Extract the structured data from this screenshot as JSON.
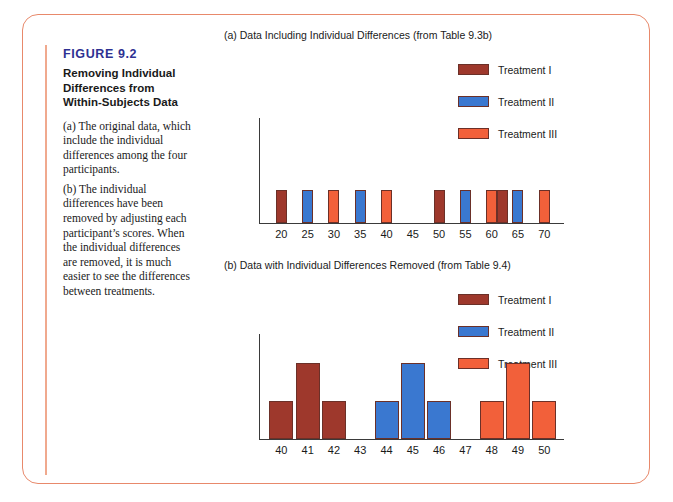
{
  "figure": {
    "number": "FIGURE 9.2",
    "title": "Removing Individual Differences from Within-Subjects Data",
    "paragraph_a": "(a) The original data, which include the individual differences among the four participants.",
    "paragraph_b": "(b) The individual differences have been removed by adjusting each participant’s scores. When the individual differences are removed, it is much easier to see the differences between treatments.",
    "border_color": "#e8896b"
  },
  "colors": {
    "treatment_1": "#9e382c",
    "treatment_2": "#3a78d0",
    "treatment_3": "#f2603a",
    "outline": "#6b3028",
    "axis": "#3a3a3a",
    "fig_number": "#2e3192"
  },
  "legend": {
    "items": [
      {
        "label": "Treatment I",
        "color": "#9e382c"
      },
      {
        "label": "Treatment II",
        "color": "#3a78d0"
      },
      {
        "label": "Treatment III",
        "color": "#f2603a"
      }
    ]
  },
  "chart_data": [
    {
      "id": "panel-a",
      "type": "bar",
      "title": "(a) Data Including Individual Differences (from Table 9.3b)",
      "xlabel": "",
      "ylabel": "",
      "grid": false,
      "legend_position": "top-right",
      "categories": [
        20,
        25,
        30,
        35,
        40,
        45,
        50,
        55,
        60,
        65,
        70
      ],
      "tick_labels": [
        "20",
        "25",
        "30",
        "35",
        "40",
        "45",
        "50",
        "55",
        "60",
        "65",
        "70"
      ],
      "ylim": [
        0,
        3
      ],
      "series": [
        {
          "name": "Treatment I",
          "color": "#9e382c",
          "points": [
            [
              20,
              1
            ],
            [
              30,
              1
            ],
            [
              50,
              1
            ],
            [
              62,
              1
            ]
          ]
        },
        {
          "name": "Treatment II",
          "color": "#3a78d0",
          "points": [
            [
              25,
              1
            ],
            [
              35,
              1
            ],
            [
              55,
              1
            ],
            [
              65,
              1
            ]
          ]
        },
        {
          "name": "Treatment III",
          "color": "#f2603a",
          "points": [
            [
              30,
              1
            ],
            [
              40,
              1
            ],
            [
              60,
              1
            ],
            [
              70,
              1
            ]
          ]
        }
      ],
      "note": "All bars have frequency 1; bars at 30 overlap (Treatment III behind Treatment I); a Treatment I bar sits just left of 65 near score 62."
    },
    {
      "id": "panel-b",
      "type": "bar",
      "title": "(b) Data with Individual Differences Removed (from Table 9.4)",
      "xlabel": "",
      "ylabel": "",
      "grid": false,
      "legend_position": "top-right",
      "categories": [
        40,
        41,
        42,
        43,
        44,
        45,
        46,
        47,
        48,
        49,
        50
      ],
      "tick_labels": [
        "40",
        "41",
        "42",
        "43",
        "44",
        "45",
        "46",
        "47",
        "48",
        "49",
        "50"
      ],
      "ylim": [
        0,
        3
      ],
      "series": [
        {
          "name": "Treatment I",
          "color": "#9e382c",
          "points": [
            [
              40,
              1
            ],
            [
              41,
              2
            ],
            [
              42,
              1
            ]
          ]
        },
        {
          "name": "Treatment II",
          "color": "#3a78d0",
          "points": [
            [
              44,
              1
            ],
            [
              45,
              2
            ],
            [
              46,
              1
            ]
          ]
        },
        {
          "name": "Treatment III",
          "color": "#f2603a",
          "points": [
            [
              48,
              1
            ],
            [
              49,
              2
            ],
            [
              50,
              1
            ]
          ]
        }
      ],
      "note": "Each treatment forms a 1-2-1 frequency distribution."
    }
  ]
}
